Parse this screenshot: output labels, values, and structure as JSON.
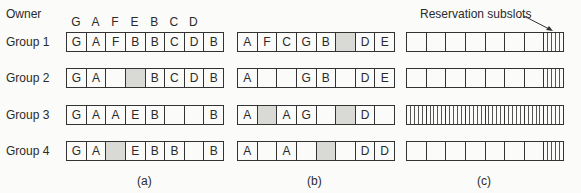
{
  "owner_label": "Owner",
  "owner_columns": [
    "G",
    "A",
    "F",
    "E",
    "B",
    "C",
    "D"
  ],
  "groups": [
    "Group 1",
    "Group 2",
    "Group 3",
    "Group 4"
  ],
  "panel_a": {
    "caption": "(a)",
    "rows": [
      [
        "G",
        "A",
        "F",
        "B",
        "B",
        "C",
        "D",
        "B"
      ],
      [
        "G",
        "A",
        "",
        "#shaded",
        "B",
        "C",
        "D",
        "B"
      ],
      [
        "G",
        "A",
        "A",
        "E",
        "B",
        "",
        "",
        "B"
      ],
      [
        "G",
        "A",
        "#shaded",
        "E",
        "B",
        "B",
        "",
        "B"
      ]
    ]
  },
  "panel_b": {
    "caption": "(b)",
    "rows": [
      [
        "A",
        "F",
        "C",
        "G",
        "B",
        "#shaded",
        "D",
        "E"
      ],
      [
        "A",
        "",
        "",
        "G",
        "B",
        "",
        "D",
        "E"
      ],
      [
        "A",
        "#shaded",
        "A",
        "G",
        "",
        "#shaded",
        "D",
        ""
      ],
      [
        "A",
        "",
        "A",
        "",
        "#shaded",
        "",
        "D",
        "D"
      ]
    ]
  },
  "panel_c": {
    "caption": "(c)",
    "annotation": "Reservation subslots",
    "rows": [
      {
        "slots": 8,
        "subslotted": [
          7
        ]
      },
      {
        "slots": 8,
        "subslotted": [
          7
        ]
      },
      {
        "slots": 8,
        "subslotted": [
          0,
          1,
          2,
          3,
          4,
          5,
          6,
          7
        ]
      },
      {
        "slots": 8,
        "subslotted": [
          7
        ]
      }
    ],
    "subslots_per_slot": 5
  }
}
